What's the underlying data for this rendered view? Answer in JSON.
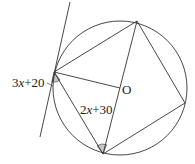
{
  "diagram": {
    "circle": {
      "cx": 120,
      "cy": 88,
      "r": 67
    },
    "center_label": "O",
    "points": {
      "A": [
        54,
        72
      ],
      "B": [
        137,
        21
      ],
      "C": [
        185,
        103
      ],
      "D": [
        103,
        154
      ],
      "O": [
        120,
        88
      ]
    },
    "tangent_line": {
      "x1": 70,
      "y1": 2,
      "x2": 40,
      "y2": 137
    },
    "angle_labels": {
      "tangent_angle": {
        "prefix": "3",
        "var": "x",
        "suffix": "+20"
      },
      "inscribed_angle": {
        "prefix": "2",
        "var": "x",
        "suffix": "+30"
      }
    },
    "colors": {
      "stroke": "#333333",
      "shade": "#c8c8c8"
    }
  }
}
